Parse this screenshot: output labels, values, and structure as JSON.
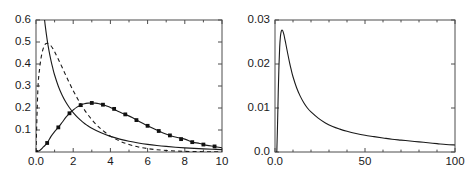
{
  "figure": {
    "kind": "two-panel-density-figure",
    "background_color": "#ffffff",
    "axis_color": "#4d4d4d",
    "curve_color": "#1a1a1a"
  },
  "chart_data": [
    {
      "type": "line",
      "panel": "left",
      "title": "",
      "xlabel": "",
      "ylabel": "",
      "xlim": [
        0,
        10
      ],
      "ylim": [
        0,
        0.6
      ],
      "grid": false,
      "legend": "none",
      "xticks": [
        0,
        2,
        4,
        6,
        8,
        10
      ],
      "xticklabels": [
        "0.0",
        "2",
        "4",
        "6",
        "8",
        "10"
      ],
      "xminorticks": [
        1,
        3,
        5,
        7,
        9
      ],
      "yticks": [
        0.1,
        0.2,
        0.3,
        0.4,
        0.5,
        0.6
      ],
      "yticklabels": [
        "0.1",
        "0.2",
        "0.3",
        "0.4",
        "0.5",
        "0.6"
      ],
      "series": [
        {
          "name": "monotone decreasing density",
          "style": "solid",
          "marker": "none",
          "note": "clipped at top of axis; enters frame above y=0.6",
          "x": [
            0.0,
            0.1,
            0.2,
            0.3,
            0.4,
            0.5,
            0.6,
            0.7,
            0.8,
            0.9,
            1.0,
            1.2,
            1.4,
            1.6,
            1.8,
            2.0,
            2.25,
            2.5,
            2.75,
            3.0,
            3.5,
            4.0,
            4.5,
            5.0,
            5.5,
            6.0,
            6.5,
            7.0,
            7.5,
            8.0,
            8.5,
            9.0,
            9.5,
            10.0
          ],
          "y": [
            1.4,
            1.08,
            0.88,
            0.745,
            0.648,
            0.572,
            0.51,
            0.46,
            0.418,
            0.382,
            0.35,
            0.299,
            0.259,
            0.227,
            0.201,
            0.179,
            0.156,
            0.137,
            0.121,
            0.108,
            0.087,
            0.071,
            0.0586,
            0.0489,
            0.0411,
            0.0348,
            0.0296,
            0.0254,
            0.0219,
            0.0189,
            0.0164,
            0.0143,
            0.0125,
            0.011
          ]
        },
        {
          "name": "unimodal density, mode near 0.5",
          "style": "dashed",
          "marker": "none",
          "x": [
            0.0,
            0.1,
            0.2,
            0.3,
            0.4,
            0.5,
            0.6,
            0.7,
            0.8,
            0.9,
            1.0,
            1.25,
            1.5,
            1.75,
            2.0,
            2.25,
            2.5,
            2.75,
            3.0,
            3.25,
            3.5,
            4.0,
            4.5,
            5.0,
            5.5,
            6.0,
            6.5,
            7.0,
            7.5,
            8.0,
            8.5,
            9.0,
            9.5,
            10.0
          ],
          "y": [
            0.0,
            0.282,
            0.383,
            0.44,
            0.473,
            0.49,
            0.494,
            0.491,
            0.483,
            0.471,
            0.456,
            0.413,
            0.367,
            0.322,
            0.279,
            0.24,
            0.205,
            0.174,
            0.147,
            0.124,
            0.104,
            0.0722,
            0.0497,
            0.0339,
            0.023,
            0.0155,
            0.0104,
            0.007,
            0.0046,
            0.0031,
            0.002,
            0.0013,
            0.0009,
            0.0006
          ]
        },
        {
          "name": "unimodal density with square markers, mode near 3",
          "style": "solid",
          "marker": "filled-square",
          "marker_x": [
            0.0,
            0.6,
            1.2,
            1.8,
            2.4,
            3.0,
            3.6,
            4.2,
            4.8,
            5.4,
            6.0,
            6.6,
            7.2,
            7.8,
            8.4,
            9.0,
            9.6
          ],
          "marker_y": [
            0.0,
            0.041,
            0.112,
            0.176,
            0.213,
            0.223,
            0.215,
            0.196,
            0.171,
            0.145,
            0.119,
            0.0955,
            0.0754,
            0.0585,
            0.0448,
            0.0339,
            0.0253
          ],
          "x": [
            0.0,
            0.2,
            0.4,
            0.6,
            0.8,
            1.0,
            1.2,
            1.4,
            1.6,
            1.8,
            2.0,
            2.2,
            2.4,
            2.6,
            2.8,
            3.0,
            3.2,
            3.4,
            3.6,
            3.8,
            4.0,
            4.4,
            4.8,
            5.2,
            5.6,
            6.0,
            6.4,
            6.8,
            7.2,
            7.6,
            8.0,
            8.4,
            8.8,
            9.2,
            9.6,
            10.0
          ],
          "y": [
            0.0,
            0.007,
            0.023,
            0.041,
            0.07,
            0.093,
            0.112,
            0.134,
            0.157,
            0.176,
            0.191,
            0.204,
            0.213,
            0.219,
            0.222,
            0.223,
            0.222,
            0.219,
            0.215,
            0.209,
            0.202,
            0.185,
            0.171,
            0.156,
            0.136,
            0.119,
            0.103,
            0.088,
            0.0754,
            0.066,
            0.0585,
            0.0448,
            0.039,
            0.03,
            0.0253,
            0.019
          ]
        }
      ]
    },
    {
      "type": "line",
      "panel": "right",
      "title": "",
      "xlabel": "",
      "ylabel": "",
      "xlim": [
        0,
        100
      ],
      "ylim": [
        0,
        0.03
      ],
      "grid": false,
      "legend": "none",
      "xticks": [
        0,
        50,
        100
      ],
      "xticklabels": [
        "0.0",
        "50",
        "100"
      ],
      "xminorticks": [
        10,
        20,
        30,
        40,
        60,
        70,
        80,
        90
      ],
      "yticks": [
        0.0,
        0.01,
        0.02,
        0.03
      ],
      "yticklabels": [
        "0.0",
        "0.01",
        "0.02",
        "0.03"
      ],
      "series": [
        {
          "name": "heavy-tailed density, sharp mode near 4.5",
          "style": "solid",
          "marker": "none",
          "x": [
            1.0,
            1.4,
            1.8,
            2.2,
            2.6,
            3.0,
            3.4,
            3.8,
            4.2,
            4.6,
            5.0,
            5.5,
            6.0,
            7.0,
            8.0,
            9.0,
            10.0,
            12.0,
            14.0,
            16.0,
            18.0,
            20.0,
            24.0,
            28.0,
            32.0,
            36.0,
            40.0,
            45.0,
            50.0,
            55.0,
            60.0,
            65.0,
            70.0,
            75.0,
            80.0,
            85.0,
            90.0,
            95.0,
            100.0
          ],
          "y": [
            0.0,
            0.006,
            0.0135,
            0.0196,
            0.0238,
            0.0262,
            0.0273,
            0.0277,
            0.0276,
            0.0272,
            0.0266,
            0.0256,
            0.0246,
            0.0225,
            0.0205,
            0.0187,
            0.0171,
            0.0146,
            0.0127,
            0.0112,
            0.01,
            0.0091,
            0.0077,
            0.0066,
            0.0058,
            0.0052,
            0.0047,
            0.0042,
            0.0038,
            0.0035,
            0.0032,
            0.0029,
            0.0027,
            0.0025,
            0.0023,
            0.0021,
            0.0019,
            0.0017,
            0.0016
          ]
        }
      ]
    }
  ]
}
